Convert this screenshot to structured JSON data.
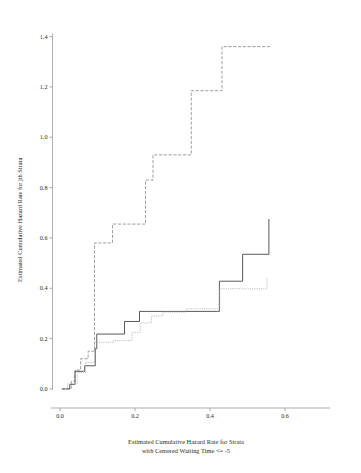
{
  "chart_data": {
    "type": "line",
    "title": "",
    "subtitle": "",
    "xlabel_line1": "Estimated Cumulative Hazard Rate for Strata",
    "xlabel_line2": "with Centered Waiting Time <= -5",
    "ylabel": "Estimated Cumulative Hazard Rate for jth Strata",
    "xlim": [
      -0.02,
      0.72
    ],
    "ylim": [
      -0.04,
      1.45
    ],
    "grid": false,
    "legend": "none",
    "step_shape": "hv",
    "xticks": [
      0.0,
      0.2,
      0.4,
      0.6
    ],
    "xtick_labels": [
      "0.0",
      "0.2",
      "0.4",
      "0.6"
    ],
    "yticks": [
      0.0,
      0.2,
      0.4,
      0.6,
      0.8,
      1.0,
      1.2,
      1.4
    ],
    "ytick_labels": [
      "0.0",
      "0.2",
      "0.4",
      "0.6",
      "0.8",
      "1.0",
      "1.2",
      "1.4"
    ],
    "series": [
      {
        "name": "upper-dash-dot-curve",
        "style": "dashed",
        "color": "#8c8c8c",
        "x": [
          0.005,
          0.02,
          0.03,
          0.04,
          0.055,
          0.075,
          0.09,
          0.092,
          0.135,
          0.14,
          0.222,
          0.228,
          0.243,
          0.248,
          0.345,
          0.35,
          0.428,
          0.432,
          0.56
        ],
        "y": [
          0.0,
          0.0,
          0.03,
          0.075,
          0.12,
          0.15,
          0.15,
          0.58,
          0.58,
          0.655,
          0.655,
          0.83,
          0.83,
          0.93,
          0.93,
          1.185,
          1.185,
          1.36,
          1.36
        ]
      },
      {
        "name": "middle-solid-curve",
        "style": "solid",
        "color": "#3d3d3d",
        "x": [
          0.005,
          0.022,
          0.026,
          0.035,
          0.04,
          0.062,
          0.066,
          0.09,
          0.094,
          0.098,
          0.168,
          0.172,
          0.208,
          0.212,
          0.42,
          0.425,
          0.482,
          0.487,
          0.552,
          0.557
        ],
        "y": [
          0.0,
          0.0,
          0.018,
          0.018,
          0.07,
          0.07,
          0.092,
          0.092,
          0.16,
          0.218,
          0.218,
          0.268,
          0.268,
          0.308,
          0.308,
          0.428,
          0.428,
          0.535,
          0.535,
          0.675
        ]
      },
      {
        "name": "lower-dotted-curve",
        "style": "dotted",
        "color": "#b2b2b2",
        "x": [
          0.005,
          0.016,
          0.02,
          0.04,
          0.046,
          0.062,
          0.068,
          0.086,
          0.092,
          0.136,
          0.142,
          0.186,
          0.192,
          0.208,
          0.214,
          0.238,
          0.244,
          0.268,
          0.274,
          0.33,
          0.336,
          0.42,
          0.426,
          0.545,
          0.552
        ],
        "y": [
          0.0,
          0.0,
          0.02,
          0.02,
          0.065,
          0.065,
          0.105,
          0.105,
          0.185,
          0.185,
          0.192,
          0.192,
          0.225,
          0.225,
          0.262,
          0.262,
          0.29,
          0.29,
          0.305,
          0.305,
          0.318,
          0.318,
          0.398,
          0.398,
          0.44
        ]
      }
    ]
  },
  "axes": {
    "x_tick_0": "0.0",
    "x_tick_1": "0.2",
    "x_tick_2": "0.4",
    "x_tick_3": "0.6",
    "y_tick_0": "0.0",
    "y_tick_1": "0.2",
    "y_tick_2": "0.4",
    "y_tick_3": "0.6",
    "y_tick_4": "0.8",
    "y_tick_5": "1.0",
    "y_tick_6": "1.2",
    "y_tick_7": "1.4"
  }
}
